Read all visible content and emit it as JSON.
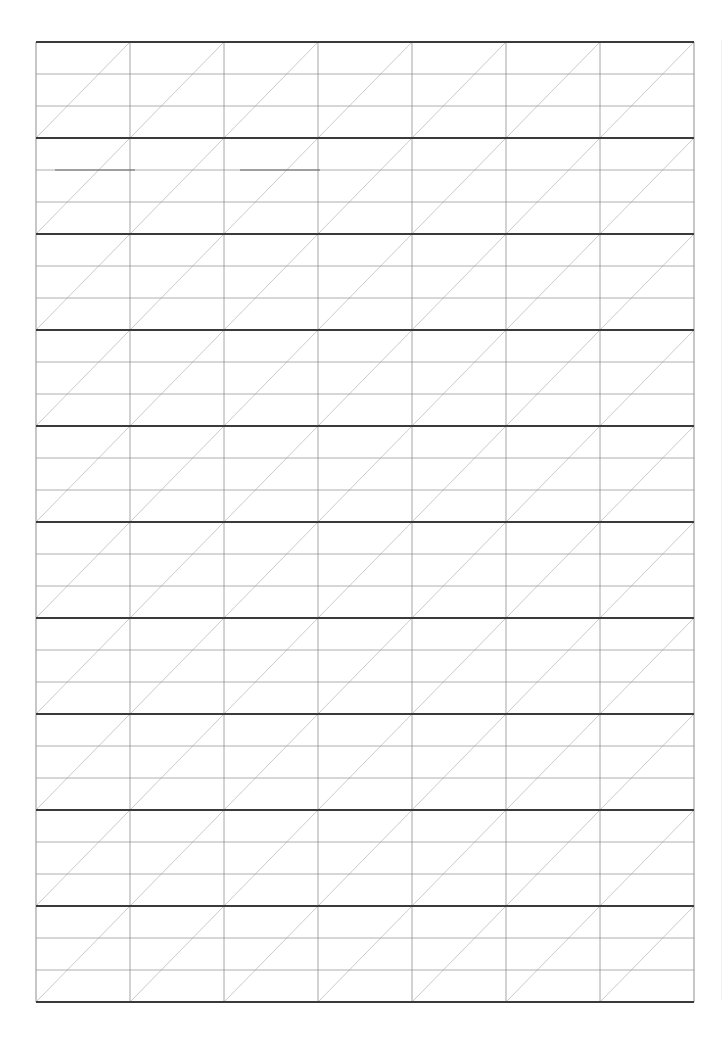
{
  "document": {
    "type": "handwriting practice sheet",
    "header_text": "",
    "page_width": 724,
    "page_height": 1048
  },
  "grid": {
    "left": 36,
    "top": 42,
    "columns": 7,
    "column_width": 94,
    "bands": 10,
    "band_height": 96,
    "sub_rows_per_band": 3,
    "diagonal": "bottom-left-to-top-right",
    "colors": {
      "band_line": "#3a3a3a",
      "guide_line": "#9a9a9a",
      "vertical_line": "#8f8f8f",
      "diagonal_line": "#c4c4c4",
      "paper": "#ffffff"
    },
    "artifacts": [
      {
        "y": 170,
        "x1": 55,
        "x2": 135
      },
      {
        "y": 170,
        "x1": 240,
        "x2": 320
      }
    ]
  }
}
